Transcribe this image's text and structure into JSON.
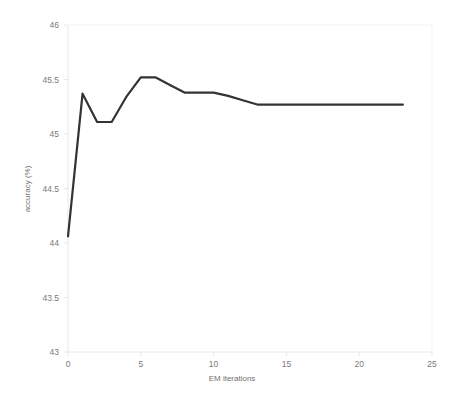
{
  "chart_data": {
    "type": "line",
    "title": "",
    "xlabel": "EM iterations",
    "ylabel": "accuracy (%)",
    "xlim": [
      0,
      25
    ],
    "ylim": [
      43,
      46
    ],
    "grid": false,
    "legend": null,
    "line_color": "#333333",
    "axis_color": "#e8e8e8",
    "xticks": [
      0,
      5,
      10,
      15,
      20,
      25
    ],
    "xtick_labels": [
      "0",
      "5",
      "10",
      "15",
      "20",
      "25"
    ],
    "yticks": [
      43,
      43.5,
      44,
      44.5,
      45,
      45.5,
      46
    ],
    "ytick_labels": [
      "43",
      "43.5",
      "44",
      "44.5",
      "45",
      "45.5",
      "46"
    ],
    "series": [
      {
        "name": "accuracy",
        "x": [
          0,
          1,
          2,
          3,
          4,
          5,
          6,
          7,
          8,
          9,
          10,
          11,
          12,
          13,
          14,
          15,
          16,
          17,
          18,
          19,
          20,
          21,
          22,
          23
        ],
        "values": [
          44.06,
          45.37,
          45.11,
          45.11,
          45.34,
          45.52,
          45.52,
          45.45,
          45.38,
          45.38,
          45.38,
          45.35,
          45.31,
          45.27,
          45.27,
          45.27,
          45.27,
          45.27,
          45.27,
          45.27,
          45.27,
          45.27,
          45.27,
          45.27
        ]
      }
    ]
  }
}
